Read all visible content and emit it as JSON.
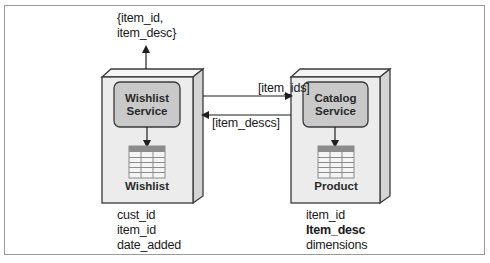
{
  "diagram": {
    "type": "service-architecture",
    "colors": {
      "frame_border": "#9a9a9a",
      "box_fill": "#ececec",
      "box_side": "#d4d4d4",
      "box_border": "#3a3a3a",
      "service_fill": "#c9c9c9",
      "db_header": "#8c8c8c",
      "db_body": "#f2f2f2",
      "line": "#1f1f1f"
    },
    "output": {
      "line1": "{item_id,",
      "line2": "item_desc}"
    },
    "nodes": [
      {
        "id": "wishlist",
        "service_line1": "Wishlist",
        "service_line2": "Service",
        "database": "Wishlist",
        "fields": [
          "cust_id",
          "item_id",
          "date_added"
        ]
      },
      {
        "id": "catalog",
        "service_line1": "Catalog",
        "service_line2": "Service",
        "database": "Product",
        "fields": [
          "item_id",
          "Item_desc",
          "dimensions"
        ],
        "bold_field_index": 1
      }
    ],
    "edges": [
      {
        "from": "wishlist",
        "to": "catalog",
        "label": "[item_ids]"
      },
      {
        "from": "catalog",
        "to": "wishlist",
        "label": "[item_descs]"
      },
      {
        "from": "wishlist",
        "to": "output",
        "label": "{item_id, item_desc}"
      }
    ]
  }
}
